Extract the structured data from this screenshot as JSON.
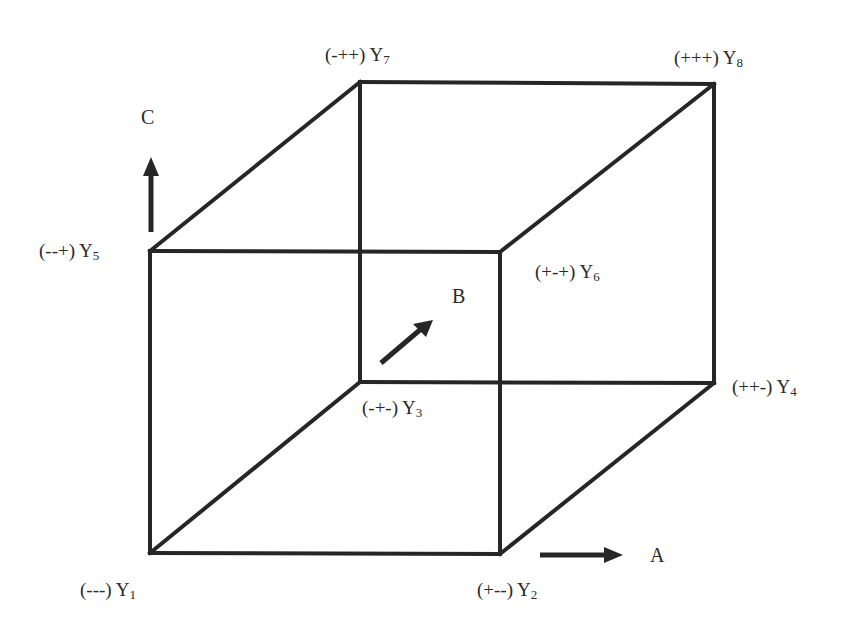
{
  "diagram": {
    "type": "2^3 factorial design cube",
    "axes": {
      "A": {
        "label": "A",
        "direction": "right"
      },
      "B": {
        "label": "B",
        "direction": "depth (diagonal up-right)"
      },
      "C": {
        "label": "C",
        "direction": "up"
      }
    },
    "vertices": [
      {
        "id": "Y1",
        "signs": "(---)",
        "name": "Y",
        "sub": "1"
      },
      {
        "id": "Y2",
        "signs": "(+--)",
        "name": "Y",
        "sub": "2"
      },
      {
        "id": "Y3",
        "signs": "(-+-)",
        "name": "Y",
        "sub": "3"
      },
      {
        "id": "Y4",
        "signs": "(++-)",
        "name": "Y",
        "sub": "4"
      },
      {
        "id": "Y5",
        "signs": "(--+)",
        "name": "Y",
        "sub": "5"
      },
      {
        "id": "Y6",
        "signs": "(+-+)",
        "name": "Y",
        "sub": "6"
      },
      {
        "id": "Y7",
        "signs": "(-++)",
        "name": "Y",
        "sub": "7"
      },
      {
        "id": "Y8",
        "signs": "(+++)",
        "name": "Y",
        "sub": "8"
      }
    ],
    "colors": {
      "line": "#262626",
      "text": "#2a2a2a",
      "background": "#ffffff"
    }
  }
}
